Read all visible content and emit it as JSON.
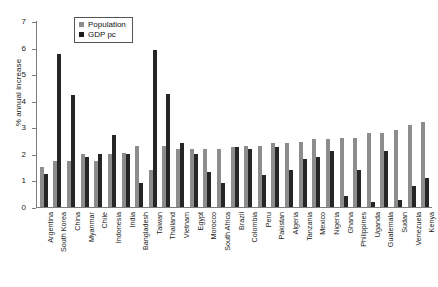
{
  "chart_data": {
    "type": "bar",
    "title": "",
    "xlabel": "",
    "ylabel": "% annual increase",
    "ylim": [
      0,
      7
    ],
    "yticks": [
      0,
      1,
      2,
      3,
      4,
      5,
      6,
      7
    ],
    "ytick_labels": [
      "0",
      "1",
      "2",
      "3",
      "4",
      "5",
      "6",
      "7"
    ],
    "grid": false,
    "legend_position": "top-left-inside",
    "orientation": "vertical",
    "categories": [
      "Argentina",
      "South Korea",
      "China",
      "Myanmar",
      "Chile",
      "Indonesia",
      "India",
      "Bangladesh",
      "Taiwan",
      "Thailand",
      "Vietnam",
      "Egypt",
      "Morocco",
      "South Africa",
      "Brazil",
      "Colombia",
      "Peru",
      "Pakistan",
      "Algeria",
      "Tanzania",
      "Mexico",
      "Nigeria",
      "Ghana",
      "Philippines",
      "Uganda",
      "Guatemala",
      "Sudan",
      "Venezuela",
      "Kenya"
    ],
    "series": [
      {
        "name": "Population",
        "color": "#8d8d8d",
        "values": [
          1.5,
          1.75,
          1.75,
          2.0,
          1.75,
          2.0,
          2.05,
          2.3,
          1.4,
          2.3,
          2.2,
          2.2,
          2.2,
          2.2,
          2.25,
          2.3,
          2.3,
          2.4,
          2.4,
          2.45,
          2.55,
          2.55,
          2.6,
          2.6,
          2.8,
          2.8,
          2.9,
          3.1,
          3.2
        ]
      },
      {
        "name": "GDP pc",
        "color": "#262626",
        "values": [
          1.25,
          5.75,
          4.2,
          1.9,
          2.0,
          2.7,
          2.0,
          0.9,
          5.9,
          4.25,
          2.4,
          2.0,
          1.3,
          0.9,
          2.25,
          2.2,
          1.2,
          2.25,
          1.4,
          1.8,
          1.9,
          2.1,
          0.4,
          1.4,
          0.2,
          2.1,
          0.25,
          0.8,
          1.1
        ]
      }
    ]
  },
  "legend": {
    "items": [
      {
        "label": "Population",
        "key": "pop"
      },
      {
        "label": "GDP pc",
        "key": "gdp"
      }
    ]
  }
}
